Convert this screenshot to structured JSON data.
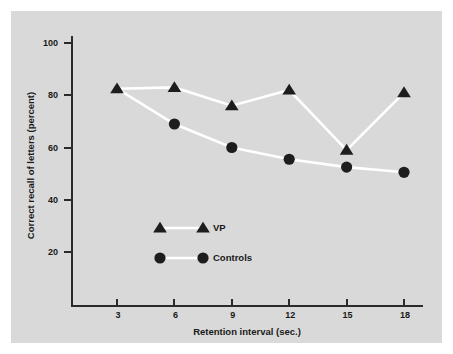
{
  "chart_data": {
    "type": "line",
    "title": "",
    "xlabel": "Retention interval (sec.)",
    "ylabel": "Correct recall of letters (percent)",
    "x": [
      3,
      6,
      9,
      12,
      15,
      18
    ],
    "xticklabels": [
      "3",
      "6",
      "9",
      "12",
      "15",
      "18"
    ],
    "yticks": [
      20,
      40,
      60,
      80,
      100
    ],
    "yticklabels": [
      "20",
      "40",
      "60",
      "80",
      "100"
    ],
    "xlim": [
      1.5,
      19.5
    ],
    "ylim": [
      14,
      104
    ],
    "grid": false,
    "legend_position": "center-left-lower",
    "series": [
      {
        "name": "VP",
        "marker": "triangle",
        "color": "#1d1d1d",
        "line_color": "#ffffff",
        "values": [
          82.5,
          83,
          76,
          82,
          59,
          81
        ]
      },
      {
        "name": "Controls",
        "marker": "circle",
        "color": "#1d1d1d",
        "line_color": "#ffffff",
        "values": [
          null,
          69,
          60,
          55.5,
          52.5,
          50.5
        ]
      }
    ]
  },
  "legend": {
    "items": [
      {
        "label": "VP",
        "marker": "triangle"
      },
      {
        "label": "Controls",
        "marker": "circle"
      }
    ]
  },
  "colors": {
    "plate_background": "#d9d9d9",
    "frame": "#ffffff",
    "axis": "#2a2a2a",
    "marker": "#1d1d1d",
    "line": "#ffffff"
  }
}
